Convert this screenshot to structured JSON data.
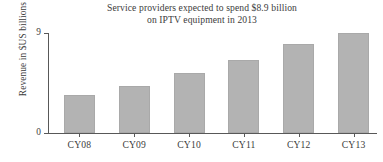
{
  "chart_data": {
    "type": "bar",
    "title": "Service providers expected to spend $8.9 billion\non IPTV equipment in 2013",
    "title_line1": "Service providers expected to spend $8.9 billion",
    "title_line2": "on IPTV equipment in 2013",
    "xlabel": "",
    "ylabel": "Revenue in $US billions",
    "categories": [
      "CY08",
      "CY09",
      "CY10",
      "CY11",
      "CY12",
      "CY13"
    ],
    "values": [
      3.4,
      4.2,
      5.4,
      6.6,
      8.0,
      9.0
    ],
    "ylim": [
      0,
      9
    ],
    "ytick_labels": [
      "0",
      "9"
    ],
    "ytick_values": [
      0,
      9
    ],
    "grid": false,
    "legend": null,
    "bar_color": "#b3b3b3",
    "axis_color": "#585858",
    "text_color": "#3c3c3c"
  }
}
